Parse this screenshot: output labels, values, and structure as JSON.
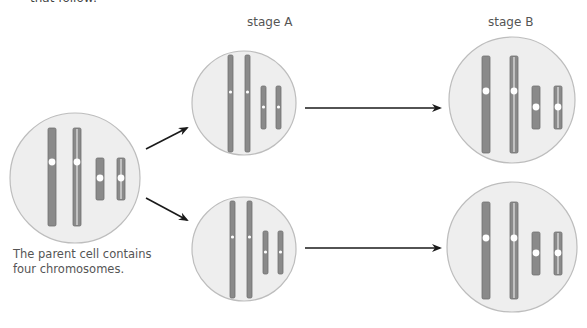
{
  "top_fragment": "that follow:",
  "labels": {
    "stage_a": "stage A",
    "stage_b": "stage B"
  },
  "caption": "The parent cell contains four chromosomes.",
  "colors": {
    "cell_fill": "#eeeeee",
    "cell_stroke": "#bdbdbd",
    "chromosome_fill": "#8a8a8a",
    "chromosome_stroke": "#6f6f6f",
    "centromere": "#ffffff",
    "arrow": "#1a1a1a"
  },
  "cells": [
    {
      "id": "parent",
      "cx": 75,
      "cy": 178,
      "r": 65,
      "chromosomes": [
        {
          "x": 48,
          "y": 128,
          "w": 8,
          "h": 98,
          "cen": 162,
          "style": "solid"
        },
        {
          "x": 73,
          "y": 128,
          "w": 8,
          "h": 98,
          "cen": 162,
          "style": "double"
        },
        {
          "x": 96,
          "y": 158,
          "w": 8,
          "h": 42,
          "cen": 178,
          "style": "solid"
        },
        {
          "x": 117,
          "y": 158,
          "w": 8,
          "h": 42,
          "cen": 178,
          "style": "double"
        }
      ]
    },
    {
      "id": "stage-a-top",
      "cx": 244,
      "cy": 103,
      "r": 52,
      "chromosomes": [
        {
          "x": 228,
          "y": 55,
          "w": 5,
          "h": 97,
          "cen": 92,
          "style": "single"
        },
        {
          "x": 245,
          "y": 55,
          "w": 5,
          "h": 97,
          "cen": 92,
          "style": "single"
        },
        {
          "x": 261,
          "y": 86,
          "w": 5,
          "h": 43,
          "cen": 107,
          "style": "single"
        },
        {
          "x": 276,
          "y": 86,
          "w": 5,
          "h": 43,
          "cen": 107,
          "style": "single"
        }
      ]
    },
    {
      "id": "stage-a-bottom",
      "cx": 244,
      "cy": 249,
      "r": 52,
      "chromosomes": [
        {
          "x": 230,
          "y": 201,
          "w": 5,
          "h": 97,
          "cen": 237,
          "style": "single"
        },
        {
          "x": 247,
          "y": 201,
          "w": 5,
          "h": 97,
          "cen": 237,
          "style": "single"
        },
        {
          "x": 263,
          "y": 231,
          "w": 5,
          "h": 43,
          "cen": 252,
          "style": "single"
        },
        {
          "x": 278,
          "y": 231,
          "w": 5,
          "h": 43,
          "cen": 252,
          "style": "single"
        }
      ]
    },
    {
      "id": "stage-b-top",
      "cx": 512,
      "cy": 100,
      "r": 63,
      "chromosomes": [
        {
          "x": 482,
          "y": 56,
          "w": 8,
          "h": 97,
          "cen": 91,
          "style": "solid"
        },
        {
          "x": 510,
          "y": 56,
          "w": 8,
          "h": 97,
          "cen": 91,
          "style": "double"
        },
        {
          "x": 532,
          "y": 86,
          "w": 8,
          "h": 43,
          "cen": 107,
          "style": "solid"
        },
        {
          "x": 554,
          "y": 86,
          "w": 8,
          "h": 43,
          "cen": 107,
          "style": "double"
        }
      ]
    },
    {
      "id": "stage-b-bottom",
      "cx": 512,
      "cy": 247,
      "r": 65,
      "chromosomes": [
        {
          "x": 482,
          "y": 202,
          "w": 8,
          "h": 97,
          "cen": 238,
          "style": "solid"
        },
        {
          "x": 510,
          "y": 202,
          "w": 8,
          "h": 97,
          "cen": 238,
          "style": "double"
        },
        {
          "x": 532,
          "y": 232,
          "w": 8,
          "h": 43,
          "cen": 253,
          "style": "solid"
        },
        {
          "x": 554,
          "y": 232,
          "w": 8,
          "h": 43,
          "cen": 253,
          "style": "double"
        }
      ]
    }
  ],
  "arrows": [
    {
      "id": "parent-to-a-top",
      "x1": 146,
      "y1": 149,
      "x2": 187,
      "y2": 128
    },
    {
      "id": "parent-to-a-bottom",
      "x1": 146,
      "y1": 198,
      "x2": 187,
      "y2": 220
    },
    {
      "id": "a-top-to-b-top",
      "x1": 305,
      "y1": 108,
      "x2": 440,
      "y2": 108
    },
    {
      "id": "a-bottom-to-b-bottom",
      "x1": 305,
      "y1": 248,
      "x2": 440,
      "y2": 248
    }
  ]
}
